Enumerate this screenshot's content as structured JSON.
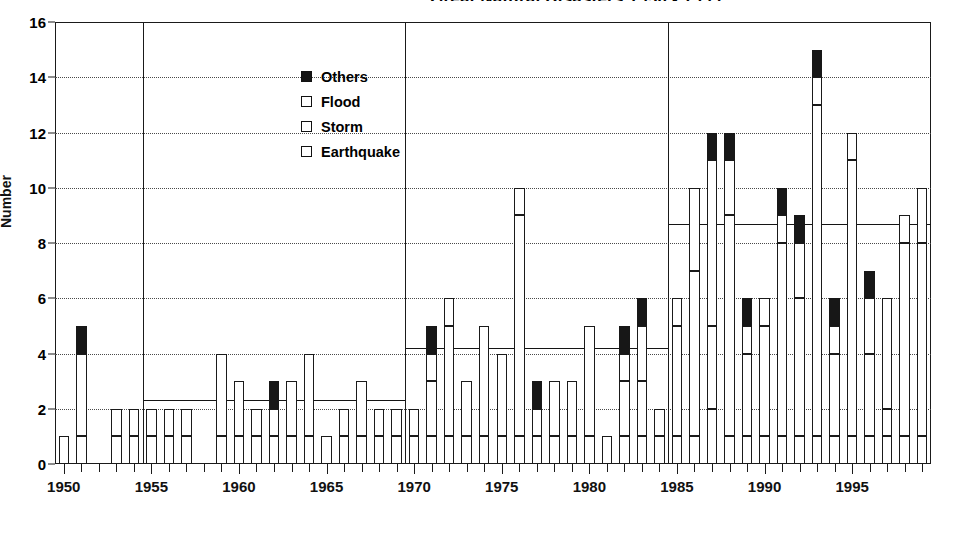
{
  "title": "Great Natural Disasters 1950 - 1999",
  "axes": {
    "ylabel": "Number",
    "yticks": [
      0,
      2,
      4,
      6,
      8,
      10,
      12,
      14,
      16
    ],
    "xticks": [
      1950,
      1955,
      1960,
      1965,
      1970,
      1975,
      1980,
      1985,
      1990,
      1995
    ]
  },
  "legend": {
    "position": "top-center-left",
    "items": [
      {
        "label": "Others",
        "swatch": "filled-square",
        "color": "#141414"
      },
      {
        "label": "Flood",
        "swatch": "empty-square",
        "color": "#ffffff"
      },
      {
        "label": "Storm",
        "swatch": "empty-square",
        "color": "#ffffff"
      },
      {
        "label": "Earthquake",
        "swatch": "empty-square",
        "color": "#ffffff"
      }
    ]
  },
  "chart_data": {
    "type": "bar",
    "stacked": true,
    "title": "Great Natural Disasters 1950 - 1999",
    "xlabel": "",
    "ylabel": "Number",
    "ylim": [
      0,
      16
    ],
    "ytick_step": 2,
    "grid": "horizontal-dotted",
    "legend_position": "inside-top-left",
    "series_order_bottom_to_top": [
      "Earthquake",
      "Storm",
      "Flood",
      "Others"
    ],
    "categories": [
      1950,
      1951,
      1952,
      1953,
      1954,
      1955,
      1956,
      1957,
      1958,
      1959,
      1960,
      1961,
      1962,
      1963,
      1964,
      1965,
      1966,
      1967,
      1968,
      1969,
      1970,
      1971,
      1972,
      1973,
      1974,
      1975,
      1976,
      1977,
      1978,
      1979,
      1980,
      1981,
      1982,
      1983,
      1984,
      1985,
      1986,
      1987,
      1988,
      1989,
      1990,
      1991,
      1992,
      1993,
      1994,
      1995,
      1996,
      1997,
      1998,
      1999
    ],
    "series": [
      {
        "name": "Earthquake",
        "values": [
          0,
          1,
          0,
          1,
          1,
          1,
          1,
          1,
          0,
          1,
          1,
          1,
          1,
          1,
          1,
          1,
          1,
          1,
          1,
          1,
          1,
          1,
          1,
          1,
          1,
          1,
          1,
          1,
          1,
          1,
          1,
          0,
          1,
          1,
          1,
          1,
          1,
          2,
          1,
          1,
          1,
          1,
          1,
          1,
          1,
          1,
          1,
          1,
          1,
          1
        ]
      },
      {
        "name": "Storm",
        "values": [
          1,
          3,
          0,
          1,
          1,
          1,
          1,
          1,
          0,
          3,
          2,
          1,
          1,
          2,
          3,
          0,
          1,
          2,
          1,
          1,
          1,
          2,
          4,
          2,
          4,
          3,
          8,
          0,
          2,
          2,
          4,
          1,
          2,
          2,
          1,
          4,
          6,
          3,
          8,
          3,
          4,
          7,
          5,
          12,
          3,
          10,
          3,
          1,
          7,
          7
        ]
      },
      {
        "name": "Flood",
        "values": [
          0,
          0,
          0,
          0,
          0,
          0,
          0,
          0,
          0,
          0,
          0,
          0,
          0,
          0,
          0,
          0,
          0,
          0,
          0,
          0,
          0,
          1,
          1,
          0,
          0,
          0,
          1,
          1,
          0,
          0,
          0,
          0,
          1,
          2,
          0,
          1,
          3,
          6,
          2,
          1,
          1,
          1,
          2,
          1,
          1,
          1,
          2,
          4,
          1,
          2
        ]
      },
      {
        "name": "Others",
        "values": [
          0,
          1,
          0,
          0,
          0,
          0,
          0,
          0,
          0,
          0,
          0,
          0,
          1,
          0,
          0,
          0,
          0,
          0,
          0,
          0,
          0,
          1,
          0,
          0,
          0,
          0,
          0,
          1,
          0,
          0,
          0,
          0,
          1,
          1,
          0,
          0,
          0,
          1,
          1,
          1,
          0,
          1,
          1,
          1,
          1,
          0,
          1,
          0,
          0,
          0
        ]
      }
    ],
    "totals": [
      1,
      5,
      0,
      2,
      2,
      2,
      2,
      2,
      0,
      4,
      3,
      2,
      3,
      3,
      4,
      1,
      2,
      3,
      2,
      2,
      2,
      5,
      6,
      3,
      5,
      4,
      10,
      3,
      3,
      3,
      5,
      1,
      5,
      6,
      2,
      6,
      10,
      12,
      11,
      6,
      6,
      10,
      9,
      15,
      6,
      12,
      7,
      6,
      9,
      10
    ],
    "period_averages": [
      {
        "period": "1950-1959",
        "value": 2.3
      },
      {
        "period": "1960-1969",
        "value": 2.3
      },
      {
        "period": "1970-1979",
        "value": 4.2
      },
      {
        "period": "1980-1989",
        "value": 4.2
      },
      {
        "period": "1990-1999",
        "value": 8.7
      }
    ],
    "period_boundaries": [
      1955,
      1970,
      1985
    ],
    "annotations": [
      "Thick horizontal lines show period averages",
      "Thick vertical lines separate 1950-1954, 1955-1969, 1970-1984, 1985-1999"
    ]
  }
}
